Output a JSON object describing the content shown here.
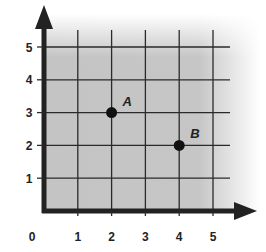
{
  "chart_data": {
    "type": "scatter",
    "title": "",
    "xlabel": "",
    "ylabel": "",
    "xlim": [
      0,
      5.5
    ],
    "ylim": [
      0,
      5.5
    ],
    "grid": true,
    "origin_label": "0",
    "x_ticks": [
      1,
      2,
      3,
      4,
      5
    ],
    "y_ticks": [
      1,
      2,
      3,
      4,
      5
    ],
    "x_tick_labels": [
      "1",
      "2",
      "3",
      "4",
      "5"
    ],
    "y_tick_labels": [
      "1",
      "2",
      "3",
      "4",
      "5"
    ],
    "points": [
      {
        "label": "A",
        "x": 2,
        "y": 3
      },
      {
        "label": "B",
        "x": 4,
        "y": 2
      }
    ],
    "colors": {
      "grid_fill": "#c4c4c4",
      "grid_line": "#2a2a2a",
      "axis": "#222222",
      "point": "#111111"
    }
  }
}
